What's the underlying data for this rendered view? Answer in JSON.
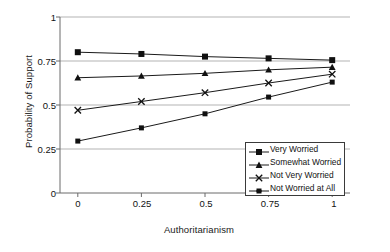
{
  "chart_data": {
    "type": "line",
    "title": "",
    "xlabel": "Authoritarianism",
    "ylabel": "Probability of Support",
    "x": [
      0,
      0.25,
      0.5,
      0.75,
      1
    ],
    "xtick_labels": [
      "0",
      "0.25",
      "0.5",
      "0.75",
      "1"
    ],
    "ytick_labels": [
      "0",
      "0.25",
      "0.5",
      "0.75",
      "1"
    ],
    "xlim": [
      -0.07,
      1.07
    ],
    "ylim": [
      0,
      1
    ],
    "grid": "horizontal",
    "legend_position": "bottom-right",
    "series": [
      {
        "name": "Very Worried",
        "marker": "square",
        "values": [
          0.8,
          0.79,
          0.775,
          0.765,
          0.755
        ]
      },
      {
        "name": "Somewhat Worried",
        "marker": "triangle",
        "values": [
          0.655,
          0.665,
          0.68,
          0.7,
          0.715
        ]
      },
      {
        "name": "Not Very Worried",
        "marker": "cross",
        "values": [
          0.47,
          0.52,
          0.57,
          0.625,
          0.675
        ]
      },
      {
        "name": "Not Worried at All",
        "marker": "square-small",
        "values": [
          0.295,
          0.37,
          0.45,
          0.545,
          0.63
        ]
      }
    ],
    "colors": {
      "series_line": "#1a1a1a",
      "marker": "#101010",
      "grid": "#b3b3b3",
      "axis": "#6b6b6b",
      "background": "#ffffff"
    }
  }
}
